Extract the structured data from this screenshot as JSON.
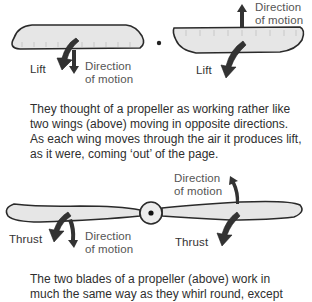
{
  "top_diagram": {
    "left_wing": {
      "lift_label": "Lift",
      "direction_label_line1": "Direction",
      "direction_label_line2": "of motion"
    },
    "right_wing": {
      "lift_label": "Lift",
      "direction_label_line1": "Direction",
      "direction_label_line2": "of motion"
    }
  },
  "caption_1": "They thought of a propeller as working rather like two wings (above) moving in opposite directions. As each wing moves through the air it produces lift, as it were, coming ‘out’ of the page.",
  "propeller_diagram": {
    "left_thrust_label": "Thrust",
    "left_direction_line1": "Direction",
    "left_direction_line2": "of motion",
    "right_thrust_label": "Thrust",
    "right_direction_line1": "Direction",
    "right_direction_line2": "of motion"
  },
  "caption_2": "The two blades of a propeller (above) work in much the same way as they whirl round, except",
  "colors": {
    "wing_fill": "#e6e6e6",
    "outline": "#2a2a2a",
    "arrow": "#333333",
    "text": "#3a3a3a"
  }
}
